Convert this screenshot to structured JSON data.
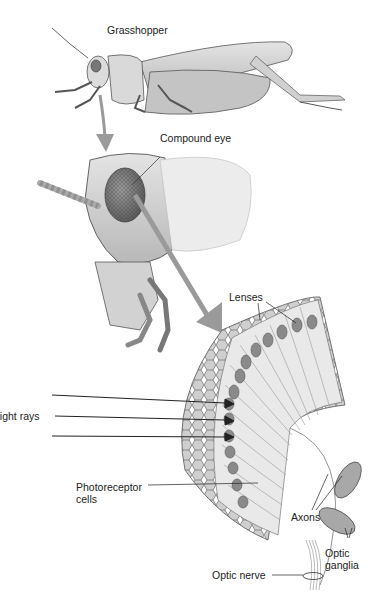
{
  "labels": {
    "grasshopper": "Grasshopper",
    "compound_eye": "Compound eye",
    "lenses": "Lenses",
    "light_rays": "Light rays",
    "photoreceptor_line1": "Photoreceptor",
    "photoreceptor_line2": "cells",
    "axons": "Axons",
    "optic_ganglia_line1": "Optic",
    "optic_ganglia_line2": "ganglia",
    "optic_nerve": "Optic nerve"
  },
  "colors": {
    "arrow": "#9a9a9a",
    "body": "#d6d6d6",
    "outline": "#555555",
    "nuclei": "#8a8a8a"
  }
}
